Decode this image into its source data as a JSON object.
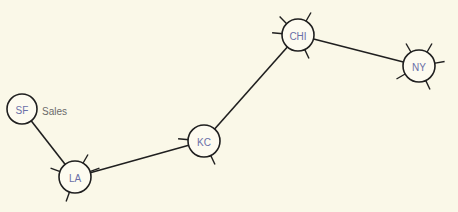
{
  "diagram": {
    "background": "#faf8e8",
    "nodes": [
      {
        "id": "SF",
        "label": "SF",
        "x": 22,
        "y": 109,
        "r": 15,
        "ticks": []
      },
      {
        "id": "LA",
        "label": "LA",
        "x": 75,
        "y": 177,
        "r": 16,
        "ticks": [
          [
            -60,
            10
          ],
          [
            200,
            10
          ],
          [
            110,
            10
          ],
          [
            340,
            10
          ]
        ]
      },
      {
        "id": "KC",
        "label": "KC",
        "x": 204,
        "y": 141,
        "r": 16,
        "ticks": [
          [
            185,
            10
          ],
          [
            65,
            10
          ]
        ]
      },
      {
        "id": "CHI",
        "label": "CHI",
        "x": 298,
        "y": 35,
        "r": 16,
        "ticks": [
          [
            225,
            10
          ],
          [
            300,
            10
          ],
          [
            185,
            10
          ],
          [
            65,
            10
          ]
        ]
      },
      {
        "id": "NY",
        "label": "NY",
        "x": 419,
        "y": 66,
        "r": 16,
        "ticks": [
          [
            240,
            10
          ],
          [
            300,
            10
          ],
          [
            350,
            10
          ],
          [
            150,
            10
          ],
          [
            65,
            10
          ]
        ]
      }
    ],
    "edges": [
      {
        "from": "SF",
        "to": "LA"
      },
      {
        "from": "LA",
        "to": "KC"
      },
      {
        "from": "KC",
        "to": "CHI"
      },
      {
        "from": "CHI",
        "to": "NY"
      }
    ],
    "annotations": [
      {
        "text": "Sales",
        "x": 42,
        "y": 111
      }
    ]
  }
}
